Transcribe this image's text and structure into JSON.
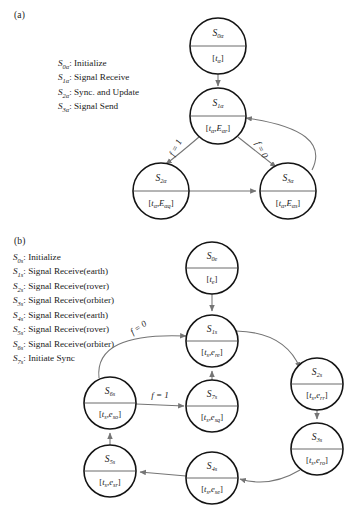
{
  "figure": {
    "panel_a": {
      "tag": "(a)",
      "legend": [
        {
          "symbol": "S",
          "subscript": "0α",
          "description": ": Initialize"
        },
        {
          "symbol": "S",
          "subscript": "1α",
          "description": ": Signal Receive"
        },
        {
          "symbol": "S",
          "subscript": "2α",
          "description": ": Sync. and Update"
        },
        {
          "symbol": "S",
          "subscript": "3α",
          "description": ": Signal Send"
        }
      ],
      "nodes": [
        {
          "id": "s0a",
          "state": "S",
          "state_sub": "0α",
          "content": "[t",
          "content_sub": "α",
          "content_tail": "]",
          "cx": 218,
          "cy": 46,
          "r": 28
        },
        {
          "id": "s1a",
          "state": "S",
          "state_sub": "1α",
          "content": "[t",
          "content_sub": "α",
          "content_tail": ",E",
          "content_sub2": "αr",
          "content_tail2": "]",
          "cx": 218,
          "cy": 116,
          "r": 28
        },
        {
          "id": "s2a",
          "state": "S",
          "state_sub": "2α",
          "content": "[t",
          "content_sub": "α",
          "content_tail": ",E",
          "content_sub2": "αq",
          "content_tail2": "]",
          "cx": 161,
          "cy": 191,
          "r": 28
        },
        {
          "id": "s3a",
          "state": "S",
          "state_sub": "3α",
          "content": "[t",
          "content_sub": "α",
          "content_tail": ",E",
          "content_sub2": "αs",
          "content_tail2": "]",
          "cx": 288,
          "cy": 191,
          "r": 28
        }
      ],
      "edge_labels": [
        {
          "id": "a-f1",
          "text": "f = 1"
        },
        {
          "id": "a-f0",
          "text": "f = 0"
        }
      ]
    },
    "panel_b": {
      "tag": "(b)",
      "legend": [
        {
          "symbol": "S",
          "subscript": "0s",
          "description": ": Initialize"
        },
        {
          "symbol": "S",
          "subscript": "1s",
          "description": ": Signal Receive(earth)"
        },
        {
          "symbol": "S",
          "subscript": "2s",
          "description": ": Signal Receive(rover)"
        },
        {
          "symbol": "S",
          "subscript": "3s",
          "description": ": Signal Receive(orbiter)"
        },
        {
          "symbol": "S",
          "subscript": "4s",
          "description": ": Signal Receive(earth)"
        },
        {
          "symbol": "S",
          "subscript": "5s",
          "description": ": Signal Receive(rover)"
        },
        {
          "symbol": "S",
          "subscript": "6s",
          "description": ": Signal Receive(orbiter)"
        },
        {
          "symbol": "S",
          "subscript": "7s",
          "description": ": Initiate Sync"
        }
      ],
      "nodes": [
        {
          "id": "s0e",
          "state": "S",
          "state_sub": "0e",
          "content": "[t",
          "content_sub": "e",
          "content_tail": "]",
          "cx": 212,
          "cy": 268,
          "r": 26
        },
        {
          "id": "s1s",
          "state": "S",
          "state_sub": "1s",
          "content": "[t",
          "content_sub": "s",
          "content_tail": ",e",
          "content_sub2": "re",
          "content_tail2": "]",
          "cx": 212,
          "cy": 341,
          "r": 26
        },
        {
          "id": "s2s",
          "state": "S",
          "state_sub": "2s",
          "content": "[t",
          "content_sub": "s",
          "content_tail": ",e",
          "content_sub2": "rr",
          "content_tail2": "]",
          "cx": 317,
          "cy": 384,
          "r": 26
        },
        {
          "id": "s3s",
          "state": "S",
          "state_sub": "3s",
          "content": "[t",
          "content_sub": "s",
          "content_tail": ",e",
          "content_sub2": "ro",
          "content_tail2": "]",
          "cx": 317,
          "cy": 449,
          "r": 26
        },
        {
          "id": "s4s",
          "state": "S",
          "state_sub": "4s",
          "content": "[t",
          "content_sub": "s",
          "content_tail": ",e",
          "content_sub2": "se",
          "content_tail2": "]",
          "cx": 212,
          "cy": 478,
          "r": 26
        },
        {
          "id": "s5s",
          "state": "S",
          "state_sub": "5s",
          "content": "[t",
          "content_sub": "s",
          "content_tail": ",e",
          "content_sub2": "sr",
          "content_tail2": "]",
          "cx": 110,
          "cy": 471,
          "r": 26
        },
        {
          "id": "s6s",
          "state": "S",
          "state_sub": "6s",
          "content": "[t",
          "content_sub": "s",
          "content_tail": ",e",
          "content_sub2": "so",
          "content_tail2": "]",
          "cx": 110,
          "cy": 403,
          "r": 26
        },
        {
          "id": "s7s",
          "state": "S",
          "state_sub": "7s",
          "content": "[t",
          "content_sub": "s",
          "content_tail": ",e",
          "content_sub2": "sq",
          "content_tail2": "]",
          "cx": 212,
          "cy": 406,
          "r": 26
        }
      ],
      "edge_labels": [
        {
          "id": "b-f0",
          "text": "f = 0"
        },
        {
          "id": "b-f1",
          "text": "f = 1"
        }
      ]
    }
  }
}
